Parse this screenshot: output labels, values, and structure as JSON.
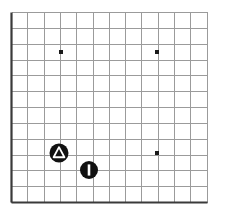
{
  "figure": {
    "title": "",
    "background_color": "#ffffff",
    "width": 225,
    "height": 217
  },
  "chart_data": {
    "type": "scatter",
    "title": "",
    "xlabel": "",
    "ylabel": "",
    "grid": true,
    "legend_position": "none",
    "axis": {
      "left_x": 11.5,
      "bottom_y": 202.5,
      "right_x": 207.5,
      "top_y": 12.5,
      "axis_color": "#3a3a3a",
      "axis_width": 2.2
    },
    "grid_spec": {
      "color": "#9b9b9b",
      "width": 1,
      "cell_size": 16.3,
      "x_gridlines": [
        11.5,
        27.8,
        44.1,
        60.4,
        76.7,
        93.0,
        109.3,
        125.6,
        141.9,
        158.2,
        174.5,
        190.8,
        207.1
      ],
      "y_gridlines": [
        12.5,
        28.3,
        44.2,
        60.0,
        75.8,
        91.7,
        107.5,
        123.3,
        139.2,
        155.0,
        170.8,
        186.7,
        202.5
      ],
      "columns": 12,
      "rows": 12
    },
    "xlim": [
      0,
      12
    ],
    "ylim": [
      0,
      12
    ],
    "tick_labels": {
      "x": [],
      "y": []
    },
    "series": [
      {
        "name": "point-markers",
        "marker": "small-square-dot",
        "color": "#1a1a1a",
        "size": 4,
        "points": [
          {
            "label": "dot-1",
            "px": 61,
            "py": 52,
            "x": 3.0,
            "y": 9.5
          },
          {
            "label": "dot-2",
            "px": 157,
            "py": 52,
            "x": 8.9,
            "y": 9.5
          },
          {
            "label": "dot-3",
            "px": 157,
            "py": 153,
            "x": 8.9,
            "y": 3.1
          }
        ]
      },
      {
        "name": "triangle-in-circle-marker",
        "marker": "circle-with-triangle",
        "color": "#111111",
        "inner_color": "#ffffff",
        "size": 19,
        "points": [
          {
            "label": "marker-a",
            "px": 59,
            "py": 153,
            "x": 2.9,
            "y": 3.1
          }
        ]
      },
      {
        "name": "bar-in-circle-marker",
        "marker": "circle-with-vertical-bar",
        "color": "#111111",
        "inner_color": "#ffffff",
        "size": 18,
        "points": [
          {
            "label": "marker-b",
            "px": 89,
            "py": 170,
            "x": 4.8,
            "y": 2.0
          }
        ]
      }
    ]
  }
}
